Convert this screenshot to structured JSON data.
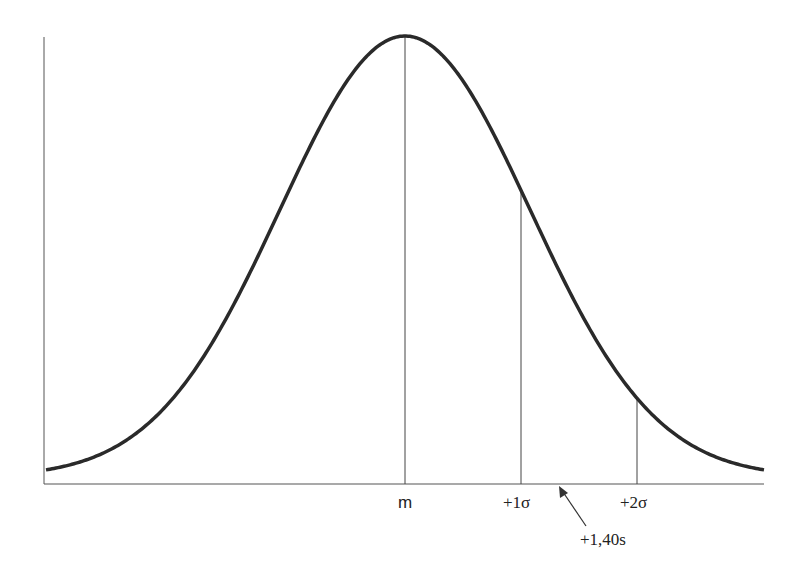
{
  "diagram": {
    "type": "normal-distribution-curve",
    "mean_label": "m",
    "markers": [
      {
        "label": "+1σ",
        "position_sigma": 1
      },
      {
        "label": "+2σ",
        "position_sigma": 2
      }
    ],
    "annotation": {
      "label": "+1,40s",
      "position_sigma": 1.4
    },
    "colors": {
      "curve": "#2a2a2a",
      "lines": "#444444",
      "background": "#ffffff"
    }
  }
}
